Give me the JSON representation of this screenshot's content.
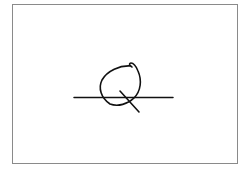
{
  "sketch": {
    "description": "Hand-drawn line sketch: an oval loop sitting on a horizontal line, with a short diagonal stroke crossing the bottom-right of the loop (resembling a Q).",
    "frame_color": "#8a8a8a",
    "stroke_color": "#111111",
    "background": "#ffffff"
  }
}
